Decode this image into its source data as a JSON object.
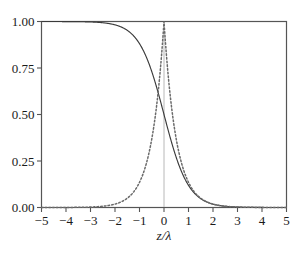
{
  "figure": {
    "background_color": "#ffffff",
    "frame_color": "#555555",
    "text_color": "#1a1a1a"
  },
  "axes": {
    "x_title": "z/λ",
    "y_title": "",
    "x_tick_labels": [
      "−5",
      "−4",
      "−3",
      "−2",
      "−1",
      "0",
      "1",
      "2",
      "3",
      "4",
      "5"
    ],
    "y_tick_labels": [
      "0.00",
      "0.25",
      "0.50",
      "0.75",
      "1.00"
    ]
  },
  "chart_data": {
    "type": "line",
    "title": "",
    "xlabel": "z/λ",
    "ylabel": "",
    "xlim": [
      -5,
      5
    ],
    "ylim": [
      0.0,
      1.0
    ],
    "xticks": [
      -5,
      -4,
      -3,
      -2,
      -1,
      0,
      1,
      2,
      3,
      4,
      5
    ],
    "yticks": [
      0.0,
      0.25,
      0.5,
      0.75,
      1.0
    ],
    "grid": false,
    "legend": "none",
    "annotations": [
      "faint vertical reference line at z/λ = 0"
    ],
    "x": [
      -5.0,
      -4.5,
      -4.0,
      -3.5,
      -3.0,
      -2.5,
      -2.0,
      -1.5,
      -1.0,
      -0.75,
      -0.5,
      -0.25,
      0.0,
      0.25,
      0.5,
      0.75,
      1.0,
      1.5,
      2.0,
      2.5,
      3.0,
      3.5,
      4.0,
      4.5,
      5.0
    ],
    "series": [
      {
        "name": "solid-curve",
        "style": "solid",
        "color": "#3a3a3a",
        "formula": "1 / (1 + exp(2 z/λ))",
        "values": [
          1.0,
          0.999,
          0.9997,
          0.9991,
          0.9975,
          0.9933,
          0.982,
          0.9526,
          0.8808,
          0.8176,
          0.7311,
          0.6225,
          0.5,
          0.3775,
          0.2689,
          0.1824,
          0.1192,
          0.0474,
          0.018,
          0.0067,
          0.0025,
          0.0009,
          0.0003,
          0.0001,
          0.0
        ]
      },
      {
        "name": "dotted-curve",
        "style": "dotted",
        "color": "#6a6a6a",
        "formula": "exp(−2 |z/λ|)",
        "values": [
          0.0,
          0.0001,
          0.0003,
          0.0009,
          0.0025,
          0.0067,
          0.0183,
          0.0498,
          0.1353,
          0.2231,
          0.3679,
          0.6065,
          1.0,
          0.6065,
          0.3679,
          0.2231,
          0.1353,
          0.0498,
          0.0183,
          0.0067,
          0.0025,
          0.0009,
          0.0003,
          0.0001,
          0.0
        ]
      }
    ]
  }
}
